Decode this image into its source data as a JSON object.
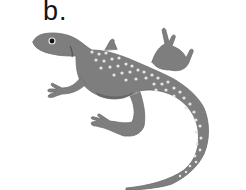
{
  "figure": {
    "panel_label": "b.",
    "colors": {
      "background": "#ffffff",
      "body": "#7e7e7e",
      "body_dark": "#666666",
      "spots": "#e6e6e6",
      "eye": "#111111",
      "label": "#141414"
    }
  }
}
